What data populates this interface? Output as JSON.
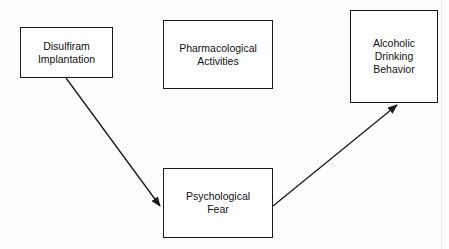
{
  "diagram": {
    "type": "flow",
    "nodes": [
      {
        "id": "disulfiram",
        "label": "Disulfiram\nImplantation"
      },
      {
        "id": "pharma",
        "label": "Pharmacological\nActivities"
      },
      {
        "id": "alcoholic",
        "label": "Alcoholic\nDrinking\nBehavior"
      },
      {
        "id": "fear",
        "label": "Psychological\nFear"
      }
    ],
    "edges": [
      {
        "from": "disulfiram",
        "to": "fear"
      },
      {
        "from": "fear",
        "to": "alcoholic"
      }
    ],
    "colors": {
      "line": "#1a1a1a",
      "text": "#111111",
      "background": "#ffffff"
    }
  }
}
